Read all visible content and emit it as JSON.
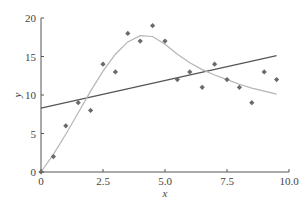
{
  "chart_data": {
    "type": "scatter",
    "title": "",
    "xlabel": "x",
    "ylabel": "y",
    "xlim": [
      0,
      10
    ],
    "ylim": [
      0,
      20
    ],
    "xticks": [
      0,
      2.5,
      5.0,
      7.5,
      10.0
    ],
    "xtick_labels": [
      "0",
      "2.5",
      "5.0",
      "7.5",
      "10.0"
    ],
    "yticks": [
      0,
      5,
      10,
      15,
      20
    ],
    "ytick_labels": [
      "0",
      "5",
      "10",
      "15",
      "20"
    ],
    "grid": false,
    "legend": null,
    "series": [
      {
        "name": "data",
        "kind": "scatter",
        "marker": "diamond",
        "color": "#6a6a6a",
        "x": [
          0,
          0.5,
          1.0,
          1.5,
          2.0,
          2.5,
          3.0,
          3.5,
          4.0,
          4.5,
          5.0,
          5.5,
          6.0,
          6.5,
          7.0,
          7.5,
          8.0,
          8.5,
          9.0,
          9.5
        ],
        "y": [
          0,
          2,
          6,
          9,
          8,
          14,
          13,
          18,
          17,
          19,
          17,
          12,
          13,
          11,
          14,
          12,
          11,
          9,
          13,
          12
        ]
      },
      {
        "name": "linear fit",
        "kind": "line",
        "color": "#555555",
        "x": [
          0,
          9.5
        ],
        "y": [
          8.3,
          15.1
        ]
      },
      {
        "name": "nonlinear fit",
        "kind": "line",
        "color": "#b5b5b5",
        "x": [
          0,
          0.5,
          1.0,
          1.5,
          2.0,
          2.5,
          3.0,
          3.5,
          4.0,
          4.5,
          5.0,
          5.5,
          6.0,
          6.5,
          7.0,
          7.5,
          8.0,
          8.5,
          9.0,
          9.5
        ],
        "y": [
          0,
          2.3,
          4.9,
          7.7,
          10.5,
          13.1,
          15.3,
          16.9,
          17.7,
          17.6,
          16.6,
          15.3,
          14.2,
          13.3,
          12.6,
          12.0,
          11.4,
          10.9,
          10.5,
          10.1
        ]
      }
    ]
  }
}
